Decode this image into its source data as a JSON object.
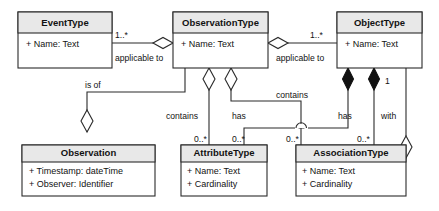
{
  "diagram": {
    "kind": "uml-class-diagram",
    "background_color": "#ffffff",
    "line_color": "#2b2b2b",
    "header_fill": "#e8e8e8",
    "body_fill": "#ffffff",
    "classes": [
      {
        "id": "event-type",
        "name": "EventType",
        "attributes": [
          "+ Name: Text"
        ]
      },
      {
        "id": "observation-type",
        "name": "ObservationType",
        "attributes": [
          "+ Name: Text"
        ]
      },
      {
        "id": "object-type",
        "name": "ObjectType",
        "attributes": [
          "+ Name: Text"
        ]
      },
      {
        "id": "observation",
        "name": "Observation",
        "attributes": [
          "+ Timestamp: dateTime",
          "+ Observer: Identifier"
        ]
      },
      {
        "id": "attribute-type",
        "name": "AttributeType",
        "attributes": [
          "+ Name: Text",
          "+ Cardinality"
        ]
      },
      {
        "id": "association-type",
        "name": "AssociationType",
        "attributes": [
          "+ Name: Text",
          "+ Cardinality"
        ]
      }
    ],
    "relations": [
      {
        "id": "eventtype-observationtype",
        "from": "event-type",
        "to": "observation-type",
        "label": "applicable to",
        "source_multiplicity": "1..*",
        "diamond": "hollow",
        "diamond_at": "observation-type"
      },
      {
        "id": "observationtype-objecttype",
        "from": "object-type",
        "to": "observation-type",
        "label": "applicable to",
        "source_multiplicity": "1..*",
        "diamond": "hollow",
        "diamond_at": "observation-type"
      },
      {
        "id": "observationtype-observation",
        "from": "observation-type",
        "to": "observation",
        "label": "is of",
        "source_multiplicity": "",
        "diamond": "hollow",
        "diamond_at": "observation"
      },
      {
        "id": "observationtype-attributetype",
        "from": "observation-type",
        "to": "attribute-type",
        "label": "contains",
        "source_multiplicity": "0..*",
        "diamond": "hollow",
        "diamond_at": "observation-type"
      },
      {
        "id": "observationtype-associationtype",
        "from": "observation-type",
        "to": "association-type",
        "label": "contains",
        "source_multiplicity": "0..*",
        "diamond": "hollow",
        "diamond_at": "observation-type"
      },
      {
        "id": "objecttype-attributetype",
        "from": "object-type",
        "to": "attribute-type",
        "label": "has",
        "source_multiplicity": "0..*",
        "diamond": "filled",
        "diamond_at": "object-type"
      },
      {
        "id": "objecttype-associationtype",
        "from": "object-type",
        "to": "association-type",
        "label": "has",
        "source_multiplicity": "0..*",
        "diamond": "filled",
        "diamond_at": "object-type"
      },
      {
        "id": "associationtype-objecttype-with",
        "from": "association-type",
        "to": "object-type",
        "label": "with",
        "source_multiplicity": "1",
        "diamond": "hollow",
        "diamond_at": "association-type"
      }
    ],
    "labels": {
      "applicable_to_left": "applicable to",
      "applicable_to_right": "applicable to",
      "is_of": "is of",
      "contains_left": "contains",
      "contains_right": "contains",
      "has_left": "has",
      "has_right": "has",
      "with": "with"
    },
    "multiplicities": {
      "eventtype_to_observationtype": "1..*",
      "objecttype_to_observationtype": "1..*",
      "contains_attributetype": "0..*",
      "has_attributetype": "0..*",
      "contains_associationtype": "0..*",
      "has_associationtype": "0..*",
      "with_objecttype": "1"
    }
  }
}
